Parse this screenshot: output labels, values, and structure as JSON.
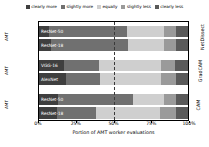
{
  "chart_data": {
    "type": "bar",
    "orientation": "horizontal",
    "stacked": true,
    "normalized": true,
    "title": "",
    "xlabel": "Portion of AMT worker evaluations",
    "ylabel": "",
    "xlim": [
      0,
      100
    ],
    "xticks": [
      "0%",
      "25%",
      "50%",
      "75%",
      "100%"
    ],
    "xtick_values": [
      0,
      25,
      50,
      75,
      100
    ],
    "grid": false,
    "median_reference_line": 50,
    "legend_position": "top",
    "legend": [
      {
        "label": "clearly more",
        "color": "#3f3f3f"
      },
      {
        "label": "slightly more",
        "color": "#707070"
      },
      {
        "label": "equally",
        "color": "#cfcfcf"
      },
      {
        "label": "slightly less",
        "color": "#9a9a9a"
      },
      {
        "label": "clearly less",
        "color": "#5a5a5a"
      }
    ],
    "categories": [
      "clearly more",
      "slightly more",
      "equally",
      "slightly less",
      "clearly less"
    ],
    "groups": [
      {
        "name": "NetDissect",
        "axis_label": "AMT",
        "bars": [
          {
            "label": "ResNet-50",
            "values": [
              7.0,
              52.0,
              25.0,
              8.0,
              8.0
            ]
          },
          {
            "label": "ResNet-18",
            "values": [
              8.0,
              52.0,
              24.0,
              8.0,
              8.0
            ]
          }
        ]
      },
      {
        "name": "GradCAM",
        "axis_label": "AMT",
        "bars": [
          {
            "label": "VGG-16",
            "values": [
              17.0,
              23.0,
              42.0,
              9.0,
              9.0
            ]
          },
          {
            "label": "AlexNet",
            "values": [
              18.0,
              23.0,
              41.0,
              10.0,
              8.0
            ]
          }
        ]
      },
      {
        "name": "CAM",
        "axis_label": "AMT",
        "bars": [
          {
            "label": "ResNet-50",
            "values": [
              13.0,
              50.0,
              21.0,
              8.0,
              8.0
            ]
          },
          {
            "label": "ResNet-18",
            "values": [
              12.0,
              26.0,
              43.0,
              11.0,
              8.0
            ]
          }
        ]
      }
    ]
  }
}
